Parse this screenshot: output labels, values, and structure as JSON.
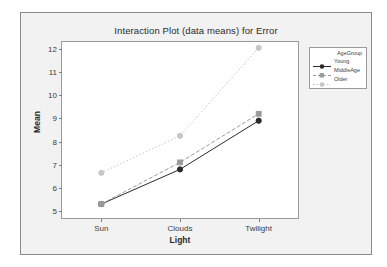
{
  "window": {
    "background_color": "#f2f2f2",
    "border_color": "#8a8a8a"
  },
  "chart_data": {
    "type": "line",
    "title": "Interaction Plot (data means) for Error",
    "xlabel": "Light",
    "ylabel": "Mean",
    "categories": [
      "Sun",
      "Clouds",
      "Twilight"
    ],
    "ylim": [
      4.7,
      12.3
    ],
    "yticks": [
      5,
      6,
      7,
      8,
      9,
      10,
      11,
      12
    ],
    "ytick_labels": [
      "5",
      "6",
      "7",
      "8",
      "9",
      "10",
      "11",
      "12"
    ],
    "grid": false,
    "legend_position": "right",
    "legend_title": "AgeGroup",
    "series": [
      {
        "name": "Young",
        "values": [
          5.3,
          6.8,
          8.9
        ],
        "color": "#2b2b2b",
        "line_style": "solid",
        "marker": "circle"
      },
      {
        "name": "MiddleAge",
        "values": [
          5.3,
          7.1,
          9.2
        ],
        "color": "#9a9a9a",
        "line_style": "dashed",
        "marker": "square"
      },
      {
        "name": "Older",
        "values": [
          6.65,
          8.25,
          12.05
        ],
        "color": "#c6c6c6",
        "line_style": "dotted",
        "marker": "circle"
      }
    ]
  }
}
